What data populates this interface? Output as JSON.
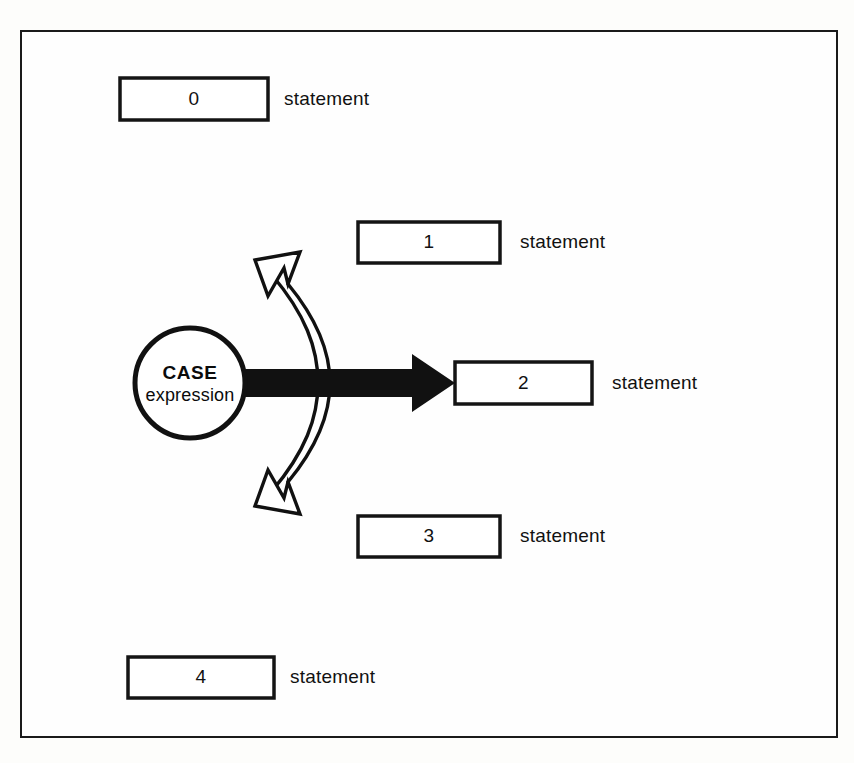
{
  "diagram": {
    "frame": {
      "present": true,
      "color": "#1a1a1a"
    },
    "decision": {
      "shape": "circle",
      "title": "CASE",
      "subtitle": "expression",
      "cx": 190,
      "cy": 383,
      "r": 55
    },
    "branches": [
      {
        "number": "0",
        "label": "statement",
        "box": {
          "x": 120,
          "y": 78,
          "w": 148,
          "h": 42
        },
        "label_x": 284,
        "selected": false
      },
      {
        "number": "1",
        "label": "statement",
        "box": {
          "x": 358,
          "y": 222,
          "w": 142,
          "h": 41
        },
        "label_x": 520,
        "selected": false
      },
      {
        "number": "2",
        "label": "statement",
        "box": {
          "x": 455,
          "y": 362,
          "w": 137,
          "h": 42
        },
        "label_x": 612,
        "selected": true
      },
      {
        "number": "3",
        "label": "statement",
        "box": {
          "x": 358,
          "y": 516,
          "w": 142,
          "h": 41
        },
        "label_x": 520,
        "selected": false
      },
      {
        "number": "4",
        "label": "statement",
        "box": {
          "x": 128,
          "y": 657,
          "w": 146,
          "h": 41
        },
        "label_x": 290,
        "selected": false
      }
    ],
    "selected_arrow": {
      "kind": "thick-solid-arrow",
      "from": "CASE expression",
      "to": "2",
      "color": "#111111"
    },
    "range_arrow": {
      "kind": "hollow-double-headed-curved-arrow",
      "heads": [
        "up-left",
        "down-left"
      ],
      "fill": "#ffffff",
      "stroke": "#111111"
    }
  }
}
